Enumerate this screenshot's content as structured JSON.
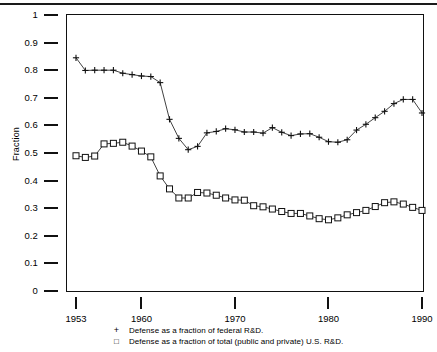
{
  "chart_data": {
    "type": "line",
    "title": "",
    "xlabel": "",
    "ylabel": "Fraction",
    "xlim": [
      1953,
      1990
    ],
    "ylim": [
      0,
      1
    ],
    "grid": false,
    "legend_position": "below-axes",
    "y_ticks": [
      "0",
      "0.1",
      "0.2",
      "0.3",
      "0.4",
      "0.5",
      "0.6",
      "0.7",
      "0.8",
      "0.9",
      "1"
    ],
    "x_ticks": [
      "1953",
      "1960",
      "1970",
      "1980",
      "1990"
    ],
    "x": [
      1953,
      1954,
      1955,
      1956,
      1957,
      1958,
      1959,
      1960,
      1961,
      1962,
      1963,
      1964,
      1965,
      1966,
      1967,
      1968,
      1969,
      1970,
      1971,
      1972,
      1973,
      1974,
      1975,
      1976,
      1977,
      1978,
      1979,
      1980,
      1981,
      1982,
      1983,
      1984,
      1985,
      1986,
      1987,
      1988,
      1989,
      1990
    ],
    "series": [
      {
        "name": "Defense as a fraction of federal R&D.",
        "marker": "plus",
        "values": [
          0.845,
          0.799,
          0.8,
          0.8,
          0.8,
          0.789,
          0.784,
          0.779,
          0.777,
          0.755,
          0.622,
          0.553,
          0.512,
          0.524,
          0.573,
          0.578,
          0.588,
          0.584,
          0.576,
          0.576,
          0.572,
          0.592,
          0.575,
          0.563,
          0.569,
          0.57,
          0.557,
          0.541,
          0.539,
          0.548,
          0.583,
          0.604,
          0.628,
          0.651,
          0.679,
          0.694,
          0.694,
          0.645
        ]
      },
      {
        "name": "Defense as a fraction of total (public and private) U.S. R&D.",
        "marker": "square",
        "values": [
          0.49,
          0.484,
          0.489,
          0.533,
          0.535,
          0.539,
          0.525,
          0.507,
          0.486,
          0.417,
          0.37,
          0.337,
          0.337,
          0.357,
          0.355,
          0.347,
          0.337,
          0.33,
          0.329,
          0.309,
          0.305,
          0.297,
          0.288,
          0.281,
          0.281,
          0.272,
          0.262,
          0.258,
          0.265,
          0.276,
          0.284,
          0.292,
          0.306,
          0.32,
          0.323,
          0.315,
          0.303,
          0.292
        ]
      }
    ]
  },
  "legend": {
    "entries": [
      {
        "marker": "+",
        "label": "Defense as a fraction of federal R&D."
      },
      {
        "marker": "□",
        "label": "Defense as a fraction of total (public and private) U.S. R&D."
      }
    ]
  },
  "axis": {
    "y_label": "Fraction"
  }
}
